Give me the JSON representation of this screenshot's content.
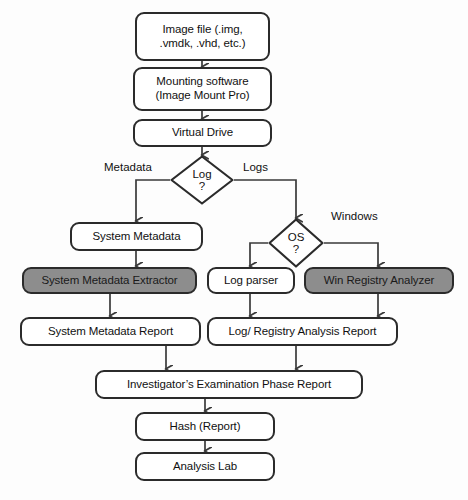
{
  "diagram": {
    "colors": {
      "stroke": "#2b2b2b",
      "fill_plain": "#ffffff",
      "fill_highlight": "#8d8d8d",
      "background": "#fdfdfd",
      "text": "#111111"
    },
    "nodes": [
      {
        "id": "image-file",
        "line1": "Image file (.img,",
        "line2": ".vmdk, .vhd, etc.)",
        "shape": "rounded-rect",
        "fill": "white"
      },
      {
        "id": "mounting-software",
        "line1": "Mounting software",
        "line2": "(Image Mount Pro)",
        "shape": "rounded-rect",
        "fill": "white"
      },
      {
        "id": "virtual-drive",
        "line1": "Virtual Drive",
        "line2": "",
        "shape": "rounded-rect",
        "fill": "white"
      },
      {
        "id": "system-metadata",
        "line1": "System Metadata",
        "line2": "",
        "shape": "rounded-rect",
        "fill": "white"
      },
      {
        "id": "system-metadata-extractor",
        "line1": "System Metadata Extractor",
        "line2": "",
        "shape": "rounded-rect",
        "fill": "gray"
      },
      {
        "id": "log-parser",
        "line1": "Log parser",
        "line2": "",
        "shape": "rounded-rect",
        "fill": "white"
      },
      {
        "id": "win-registry-analyzer",
        "line1": "Win Registry Analyzer",
        "line2": "",
        "shape": "rounded-rect",
        "fill": "gray"
      },
      {
        "id": "system-metadata-report",
        "line1": "System Metadata Report",
        "line2": "",
        "shape": "rounded-rect",
        "fill": "white"
      },
      {
        "id": "log-registry-analysis-report",
        "line1": "Log/ Registry Analysis Report",
        "line2": "",
        "shape": "rounded-rect",
        "fill": "white"
      },
      {
        "id": "investigator-report",
        "line1": "Investigator’s Examination Phase  Report",
        "line2": "",
        "shape": "rounded-rect",
        "fill": "white"
      },
      {
        "id": "hash-report",
        "line1": "Hash (Report)",
        "line2": "",
        "shape": "rounded-rect",
        "fill": "white"
      },
      {
        "id": "analysis-lab",
        "line1": "Analysis Lab",
        "line2": "",
        "shape": "rounded-rect",
        "fill": "white"
      }
    ],
    "decisions": [
      {
        "id": "log-decision",
        "line1": "Log",
        "line2": "?"
      },
      {
        "id": "os-decision",
        "line1": "OS",
        "line2": "?"
      }
    ],
    "edge_labels": [
      {
        "id": "metadata-label",
        "text": "Metadata"
      },
      {
        "id": "logs-label",
        "text": "Logs"
      },
      {
        "id": "windows-label",
        "text": "Windows"
      }
    ]
  }
}
